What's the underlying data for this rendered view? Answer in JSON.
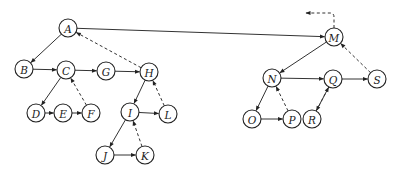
{
  "diagram": {
    "type": "threaded-forest-binary-tree",
    "nodes": [
      {
        "id": "A",
        "label": "A",
        "x": 68,
        "y": 28
      },
      {
        "id": "B",
        "label": "B",
        "x": 24,
        "y": 69
      },
      {
        "id": "C",
        "label": "C",
        "x": 66,
        "y": 70
      },
      {
        "id": "G",
        "label": "G",
        "x": 106,
        "y": 71
      },
      {
        "id": "H",
        "label": "H",
        "x": 149,
        "y": 72
      },
      {
        "id": "D",
        "label": "D",
        "x": 36,
        "y": 113
      },
      {
        "id": "E",
        "label": "E",
        "x": 63,
        "y": 113
      },
      {
        "id": "F",
        "label": "F",
        "x": 91,
        "y": 113
      },
      {
        "id": "I",
        "label": "I",
        "x": 130,
        "y": 112
      },
      {
        "id": "L",
        "label": "L",
        "x": 168,
        "y": 114
      },
      {
        "id": "J",
        "label": "J",
        "x": 105,
        "y": 155
      },
      {
        "id": "K",
        "label": "K",
        "x": 145,
        "y": 155
      },
      {
        "id": "M",
        "label": "M",
        "x": 334,
        "y": 37
      },
      {
        "id": "N",
        "label": "N",
        "x": 272,
        "y": 78
      },
      {
        "id": "Q",
        "label": "Q",
        "x": 333,
        "y": 79
      },
      {
        "id": "S",
        "label": "S",
        "x": 377,
        "y": 79
      },
      {
        "id": "O",
        "label": "O",
        "x": 252,
        "y": 119
      },
      {
        "id": "P",
        "label": "P",
        "x": 292,
        "y": 119
      },
      {
        "id": "R",
        "label": "R",
        "x": 312,
        "y": 119
      }
    ],
    "solid_edges": [
      [
        "A",
        "B"
      ],
      [
        "A",
        "M"
      ],
      [
        "B",
        "C"
      ],
      [
        "C",
        "G"
      ],
      [
        "G",
        "H"
      ],
      [
        "C",
        "D"
      ],
      [
        "D",
        "E"
      ],
      [
        "E",
        "F"
      ],
      [
        "H",
        "I"
      ],
      [
        "I",
        "L"
      ],
      [
        "I",
        "J"
      ],
      [
        "J",
        "K"
      ],
      [
        "M",
        "N"
      ],
      [
        "N",
        "Q"
      ],
      [
        "Q",
        "S"
      ],
      [
        "N",
        "O"
      ],
      [
        "O",
        "P"
      ],
      [
        "Q",
        "R"
      ]
    ],
    "dashed_edges": [
      [
        "H",
        "A"
      ],
      [
        "F",
        "C"
      ],
      [
        "L",
        "H"
      ],
      [
        "K",
        "I"
      ],
      [
        "S",
        "M"
      ],
      [
        "P",
        "N"
      ],
      [
        "R",
        "Q"
      ]
    ],
    "root_thread": {
      "from": "M",
      "via": [
        334,
        13
      ],
      "to": [
        306,
        13
      ]
    }
  }
}
